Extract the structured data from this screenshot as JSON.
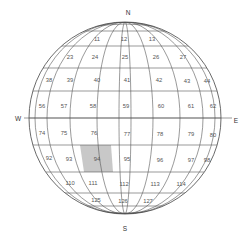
{
  "diagram": {
    "directions": {
      "north": "N",
      "south": "S",
      "west": "W",
      "east": "E"
    },
    "highlight_color": "#c8c8c8",
    "line_color": "#555555",
    "highlighted_cell": "94",
    "rows": [
      {
        "cells": [
          "11",
          "12",
          "13"
        ]
      },
      {
        "cells": [
          "23",
          "24",
          "25",
          "26",
          "27"
        ]
      },
      {
        "cells": [
          "38",
          "39",
          "40",
          "41",
          "42",
          "43",
          "44"
        ]
      },
      {
        "cells": [
          "56",
          "57",
          "58",
          "59",
          "60",
          "61",
          "62"
        ]
      },
      {
        "cells": [
          "74",
          "75",
          "76",
          "77",
          "78",
          "79",
          "80"
        ]
      },
      {
        "cells": [
          "92",
          "93",
          "94",
          "95",
          "96",
          "97",
          "98"
        ]
      },
      {
        "cells": [
          "110",
          "111",
          "112",
          "113",
          "114"
        ]
      },
      {
        "cells": [
          "125",
          "126",
          "127"
        ]
      }
    ]
  }
}
